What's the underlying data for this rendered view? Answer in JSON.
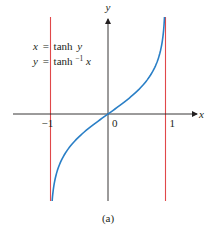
{
  "chart_data": {
    "type": "line",
    "title": "",
    "caption": "(a)",
    "xlabel": "x",
    "ylabel": "y",
    "xlim": [
      -1.4,
      1.55
    ],
    "ylim": [
      -2.2,
      2.35
    ],
    "x_ticks": [
      {
        "value": -1,
        "label": "−1"
      },
      {
        "value": 0,
        "label": "0"
      },
      {
        "value": 1,
        "label": "1"
      }
    ],
    "grid": false,
    "series": [
      {
        "name": "y = tanh⁻¹x",
        "function": "atanh",
        "x_range": [
          -0.98,
          0.98
        ],
        "color": "#2a7fc6"
      }
    ],
    "asymptotes": [
      {
        "x": -1,
        "color": "#e0484a"
      },
      {
        "x": 1,
        "color": "#e0484a"
      }
    ],
    "annotations": [
      {
        "lhs": "x",
        "eq": "=",
        "rhs": "tanh",
        "arg": "y"
      },
      {
        "lhs": "y",
        "eq": "=",
        "rhs": "tanh",
        "sup": "−1",
        "arg": "x"
      }
    ],
    "axis_color": "#231f20"
  }
}
